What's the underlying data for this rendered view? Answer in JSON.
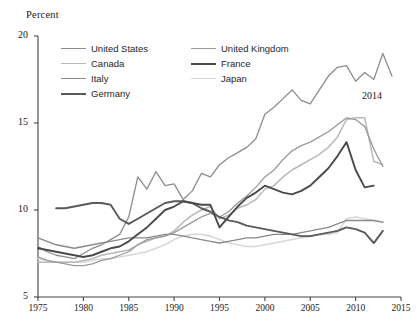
{
  "axes": {
    "ylabel": "Percent",
    "yticks": [
      5,
      10,
      15,
      20
    ],
    "xticks": [
      1975,
      1980,
      1985,
      1990,
      1995,
      2000,
      2005,
      2010,
      2015
    ],
    "ylim": [
      5,
      20
    ],
    "xlim": [
      1975,
      2015
    ]
  },
  "annotation": {
    "end_year_label": "2014"
  },
  "legend": {
    "left": [
      {
        "label": "United States",
        "color": "#8c8c8c"
      },
      {
        "label": "Canada",
        "color": "#b8b8b8"
      },
      {
        "label": "Italy",
        "color": "#8a8a8a"
      },
      {
        "label": "Germany",
        "color": "#5a5a5a"
      }
    ],
    "right": [
      {
        "label": "United Kingdom",
        "color": "#9a9a9a"
      },
      {
        "label": "France",
        "color": "#4a4a4a"
      },
      {
        "label": "Japan",
        "color": "#d8d8d8"
      }
    ]
  },
  "chart_data": {
    "type": "line",
    "title": "",
    "subtitle": "",
    "xlabel": "",
    "ylabel": "Percent",
    "xlim": [
      1975,
      2015
    ],
    "ylim": [
      5,
      20
    ],
    "xticks": [
      1975,
      1980,
      1985,
      1990,
      1995,
      2000,
      2005,
      2010,
      2015
    ],
    "yticks": [
      5,
      10,
      15,
      20
    ],
    "grid": false,
    "legend_position": "top-center",
    "annotations": [
      {
        "text": "2014",
        "x": 2012.6,
        "y": 17.2
      }
    ],
    "series": [
      {
        "name": "United States",
        "color": "#8c8c8c",
        "x": [
          1975,
          1976,
          1977,
          1978,
          1979,
          1980,
          1981,
          1982,
          1983,
          1984,
          1985,
          1986,
          1987,
          1988,
          1989,
          1990,
          1991,
          1992,
          1993,
          1994,
          1995,
          1996,
          1997,
          1998,
          1999,
          2000,
          2001,
          2002,
          2003,
          2004,
          2005,
          2006,
          2007,
          2008,
          2009,
          2010,
          2011,
          2012,
          2013,
          2014
        ],
        "y": [
          7.9,
          7.6,
          7.4,
          7.3,
          7.2,
          7.5,
          7.8,
          8.0,
          8.3,
          8.6,
          9.6,
          11.9,
          11.2,
          12.2,
          11.4,
          11.5,
          10.6,
          11.1,
          12.1,
          11.9,
          12.6,
          13.0,
          13.3,
          13.6,
          14.1,
          15.5,
          15.9,
          16.4,
          16.9,
          16.3,
          16.1,
          16.9,
          17.7,
          18.2,
          18.3,
          17.4,
          17.9,
          17.5,
          19.0,
          17.7
        ]
      },
      {
        "name": "United Kingdom",
        "color": "#9a9a9a",
        "x": [
          1975,
          1976,
          1977,
          1978,
          1979,
          1980,
          1981,
          1982,
          1983,
          1984,
          1985,
          1986,
          1987,
          1988,
          1989,
          1990,
          1991,
          1992,
          1993,
          1994,
          1995,
          1996,
          1997,
          1998,
          1999,
          2000,
          2001,
          2002,
          2003,
          2004,
          2005,
          2006,
          2007,
          2008,
          2009,
          2010,
          2011,
          2012,
          2013
        ],
        "y": [
          7.3,
          7.1,
          7.0,
          6.9,
          6.8,
          6.8,
          6.9,
          7.1,
          7.2,
          7.4,
          7.6,
          8.0,
          8.3,
          8.4,
          8.5,
          8.7,
          9.0,
          9.3,
          9.6,
          9.8,
          9.6,
          9.9,
          10.4,
          10.8,
          11.3,
          11.9,
          12.3,
          12.9,
          13.4,
          13.7,
          13.9,
          14.2,
          14.5,
          14.9,
          15.3,
          15.2,
          14.8,
          13.5,
          12.5
        ]
      },
      {
        "name": "Canada",
        "color": "#b8b8b8",
        "x": [
          1975,
          1976,
          1977,
          1978,
          1979,
          1980,
          1981,
          1982,
          1983,
          1984,
          1985,
          1986,
          1987,
          1988,
          1989,
          1990,
          1991,
          1992,
          1993,
          1994,
          1995,
          1996,
          1997,
          1998,
          1999,
          2000,
          2001,
          2002,
          2003,
          2004,
          2005,
          2006,
          2007,
          2008,
          2009,
          2010,
          2011,
          2012,
          2013
        ],
        "y": [
          7.0,
          7.0,
          7.0,
          7.0,
          7.0,
          7.1,
          7.2,
          7.4,
          7.5,
          7.6,
          7.7,
          8.0,
          8.2,
          8.4,
          8.5,
          8.8,
          9.3,
          9.7,
          10.0,
          10.2,
          9.5,
          9.7,
          10.1,
          10.3,
          10.6,
          11.2,
          11.4,
          11.9,
          12.3,
          12.6,
          12.9,
          13.2,
          13.6,
          14.2,
          15.2,
          15.3,
          15.3,
          12.8,
          12.6
        ]
      },
      {
        "name": "France",
        "color": "#4a4a4a",
        "x": [
          1975,
          1976,
          1977,
          1978,
          1979,
          1980,
          1981,
          1982,
          1983,
          1984,
          1985,
          1986,
          1987,
          1988,
          1989,
          1990,
          1991,
          1992,
          1993,
          1994,
          1995,
          1996,
          1997,
          1998,
          1999,
          2000,
          2001,
          2002,
          2003,
          2004,
          2005,
          2006,
          2007,
          2008,
          2009,
          2010,
          2011,
          2012
        ],
        "y": [
          7.8,
          7.7,
          7.6,
          7.5,
          7.4,
          7.3,
          7.4,
          7.6,
          7.8,
          7.9,
          8.2,
          8.6,
          9.0,
          9.5,
          10.0,
          10.2,
          10.5,
          10.4,
          10.3,
          10.3,
          9.0,
          9.6,
          10.2,
          10.7,
          11.0,
          11.4,
          11.2,
          11.0,
          10.9,
          11.1,
          11.4,
          11.9,
          12.4,
          13.1,
          13.9,
          12.3,
          11.3,
          11.4
        ]
      },
      {
        "name": "Italy",
        "color": "#8a8a8a",
        "x": [
          1975,
          1976,
          1977,
          1978,
          1979,
          1980,
          1981,
          1982,
          1983,
          1984,
          1985,
          1986,
          1987,
          1988,
          1989,
          1990,
          1991,
          1992,
          1993,
          1994,
          1995,
          1996,
          1997,
          1998,
          1999,
          2000,
          2001,
          2002,
          2003,
          2004,
          2005,
          2006,
          2007,
          2008,
          2009,
          2010,
          2011,
          2012,
          2013
        ],
        "y": [
          8.4,
          8.2,
          8.0,
          7.9,
          7.8,
          7.9,
          8.0,
          8.1,
          8.2,
          8.3,
          8.4,
          8.4,
          8.4,
          8.5,
          8.6,
          8.6,
          8.5,
          8.4,
          8.3,
          8.2,
          8.1,
          8.2,
          8.3,
          8.4,
          8.4,
          8.5,
          8.6,
          8.6,
          8.6,
          8.7,
          8.8,
          8.9,
          9.0,
          9.2,
          9.4,
          9.4,
          9.4,
          9.4,
          9.3
        ]
      },
      {
        "name": "Germany",
        "color": "#5a5a5a",
        "x": [
          1977,
          1978,
          1979,
          1980,
          1981,
          1982,
          1983,
          1984,
          1985,
          1986,
          1987,
          1988,
          1989,
          1990,
          1991,
          1992,
          1993,
          1994,
          1995,
          1996,
          1997,
          1998,
          1999,
          2000,
          2001,
          2002,
          2003,
          2004,
          2005,
          2006,
          2007,
          2008,
          2009,
          2010,
          2011,
          2012,
          2013
        ],
        "y": [
          10.1,
          10.1,
          10.2,
          10.3,
          10.4,
          10.4,
          10.3,
          9.5,
          9.2,
          9.5,
          9.8,
          10.1,
          10.4,
          10.5,
          10.5,
          10.4,
          10.1,
          9.9,
          9.6,
          9.4,
          9.3,
          9.1,
          9.0,
          8.9,
          8.8,
          8.7,
          8.6,
          8.5,
          8.5,
          8.6,
          8.7,
          8.8,
          9.0,
          8.9,
          8.7,
          8.1,
          8.8
        ]
      },
      {
        "name": "Japan",
        "color": "#d8d8d8",
        "x": [
          1975,
          1976,
          1977,
          1978,
          1979,
          1980,
          1981,
          1982,
          1983,
          1984,
          1985,
          1986,
          1987,
          1988,
          1989,
          1990,
          1991,
          1992,
          1993,
          1994,
          1995,
          1996,
          1997,
          1998,
          1999,
          2000,
          2001,
          2002,
          2003,
          2004,
          2005,
          2006,
          2007,
          2008,
          2009,
          2010,
          2011,
          2012,
          2013
        ],
        "y": [
          7.2,
          7.1,
          7.0,
          7.0,
          7.0,
          7.0,
          7.1,
          7.2,
          7.2,
          7.3,
          7.4,
          7.5,
          7.6,
          7.8,
          8.0,
          8.3,
          8.5,
          8.6,
          8.6,
          8.5,
          8.3,
          8.1,
          8.0,
          7.9,
          7.9,
          8.0,
          8.1,
          8.2,
          8.3,
          8.4,
          8.5,
          8.6,
          8.6,
          8.7,
          9.5,
          9.6,
          9.5,
          9.4,
          9.3
        ]
      }
    ]
  }
}
